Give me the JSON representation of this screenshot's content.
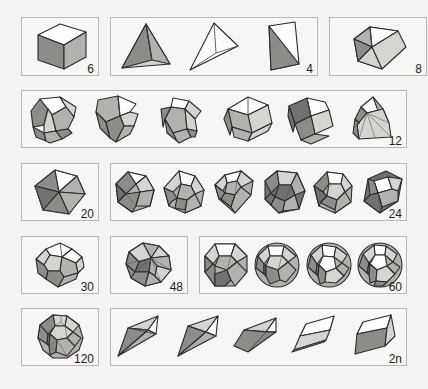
{
  "figure": {
    "kind": "polyhedra-face-count-chart",
    "background_color": "#f4f3f1",
    "box_border_color": "#b9b7b4",
    "label_color": "#1d1d1d",
    "shading_palette": [
      "#fdfdfc",
      "#d5d4d1",
      "#b3b1ae",
      "#8e8c89",
      "#737170"
    ]
  },
  "rows": [
    {
      "row_index": 1,
      "groups": [
        {
          "label": "6",
          "count": 1,
          "shape_names": [
            "cube"
          ]
        },
        {
          "label": "4",
          "count": 3,
          "shape_names": [
            "tetrahedron-shaded",
            "tetrahedron-outline",
            "tetrahedron-flattened"
          ]
        },
        {
          "label": "8",
          "count": 1,
          "shape_names": [
            "octahedron"
          ]
        }
      ]
    },
    {
      "row_index": 2,
      "groups": [
        {
          "label": "12",
          "count": 6,
          "shape_names": [
            "dodecahedron",
            "pyritohedron-a",
            "pyritohedron-b",
            "rhombic-dodecahedron",
            "rhombic-dodecahedron-b",
            "trigonal-dodecahedron"
          ]
        }
      ]
    },
    {
      "row_index": 3,
      "groups": [
        {
          "label": "20",
          "count": 1,
          "shape_names": [
            "icosahedron"
          ]
        },
        {
          "label": "24",
          "count": 6,
          "shape_names": [
            "tetrakis-hexahedron",
            "deltoidal-icositetrahedron",
            "triakis-octahedron",
            "pentagonal-icositetrahedron",
            "trapezohedron-24",
            "hexakis-form"
          ]
        }
      ]
    },
    {
      "row_index": 4,
      "groups": [
        {
          "label": "30",
          "count": 1,
          "shape_names": [
            "rhombic-triacontahedron"
          ]
        },
        {
          "label": "48",
          "count": 1,
          "shape_names": [
            "hexakis-octahedron"
          ]
        },
        {
          "label": "60",
          "count": 4,
          "shape_names": [
            "pentakis-dodecahedron",
            "deltoidal-hexecontahedron",
            "pentagonal-hexecontahedron",
            "rhombic-hexecontahedron"
          ]
        }
      ]
    },
    {
      "row_index": 5,
      "groups": [
        {
          "label": "120",
          "count": 1,
          "shape_names": [
            "hexakis-icosahedron"
          ]
        },
        {
          "label": "2n",
          "count": 5,
          "shape_names": [
            "bipyramid-a",
            "bipyramid-b",
            "bipyramid-c",
            "rhombohedron-a",
            "rhombohedron-b"
          ]
        }
      ]
    }
  ],
  "labels": {
    "r1g1": "6",
    "r1g2": "4",
    "r1g3": "8",
    "r2g1": "12",
    "r3g1": "20",
    "r3g2": "24",
    "r4g1": "30",
    "r4g2": "48",
    "r4g3": "60",
    "r5g1": "120",
    "r5g2": "2n"
  }
}
